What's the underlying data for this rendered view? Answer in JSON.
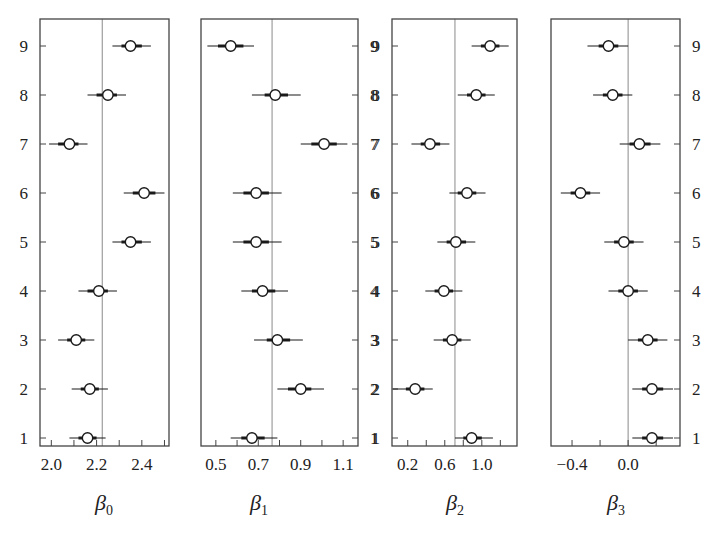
{
  "chart_data": {
    "type": "forest",
    "categories": [
      "1",
      "2",
      "3",
      "4",
      "5",
      "6",
      "7",
      "8",
      "9"
    ],
    "panels": [
      {
        "id": "beta0",
        "xlabel": "β",
        "xlabel_sub": "0",
        "xlim": [
          1.95,
          2.52
        ],
        "xticks_major": [
          2.0,
          2.2,
          2.4
        ],
        "xticks_minor": [
          2.0,
          2.1,
          2.2,
          2.3,
          2.4,
          2.5
        ],
        "tick_labels": [
          "2.0",
          "2.2",
          "2.4"
        ],
        "ref_line": 2.225,
        "ylabels_side": "left",
        "points": [
          {
            "group": 1,
            "est": 2.16,
            "lo": 2.08,
            "hi": 2.24,
            "inner_lo": 2.12,
            "inner_hi": 2.2
          },
          {
            "group": 2,
            "est": 2.17,
            "lo": 2.09,
            "hi": 2.25,
            "inner_lo": 2.13,
            "inner_hi": 2.21
          },
          {
            "group": 3,
            "est": 2.11,
            "lo": 2.03,
            "hi": 2.19,
            "inner_lo": 2.07,
            "inner_hi": 2.15
          },
          {
            "group": 4,
            "est": 2.21,
            "lo": 2.12,
            "hi": 2.29,
            "inner_lo": 2.16,
            "inner_hi": 2.25
          },
          {
            "group": 5,
            "est": 2.35,
            "lo": 2.27,
            "hi": 2.44,
            "inner_lo": 2.31,
            "inner_hi": 2.4
          },
          {
            "group": 6,
            "est": 2.41,
            "lo": 2.32,
            "hi": 2.5,
            "inner_lo": 2.36,
            "inner_hi": 2.46
          },
          {
            "group": 7,
            "est": 2.08,
            "lo": 1.99,
            "hi": 2.16,
            "inner_lo": 2.03,
            "inner_hi": 2.12
          },
          {
            "group": 8,
            "est": 2.25,
            "lo": 2.16,
            "hi": 2.33,
            "inner_lo": 2.2,
            "inner_hi": 2.29
          },
          {
            "group": 9,
            "est": 2.35,
            "lo": 2.27,
            "hi": 2.44,
            "inner_lo": 2.31,
            "inner_hi": 2.4
          }
        ]
      },
      {
        "id": "beta1",
        "xlabel": "β",
        "xlabel_sub": "1",
        "xlim": [
          0.43,
          1.17
        ],
        "xticks_major": [
          0.5,
          0.7,
          0.9,
          1.1
        ],
        "xticks_minor": [
          0.5,
          0.6,
          0.7,
          0.8,
          0.9,
          1.0,
          1.1
        ],
        "tick_labels": [
          "0.5",
          "0.7",
          "0.9",
          "1.1"
        ],
        "ref_line": 0.765,
        "ylabels_side": "right",
        "points": [
          {
            "group": 1,
            "est": 0.67,
            "lo": 0.57,
            "hi": 0.79,
            "inner_lo": 0.62,
            "inner_hi": 0.73
          },
          {
            "group": 2,
            "est": 0.9,
            "lo": 0.79,
            "hi": 1.01,
            "inner_lo": 0.84,
            "inner_hi": 0.95
          },
          {
            "group": 3,
            "est": 0.79,
            "lo": 0.68,
            "hi": 0.91,
            "inner_lo": 0.74,
            "inner_hi": 0.85
          },
          {
            "group": 4,
            "est": 0.72,
            "lo": 0.62,
            "hi": 0.84,
            "inner_lo": 0.67,
            "inner_hi": 0.78
          },
          {
            "group": 5,
            "est": 0.69,
            "lo": 0.58,
            "hi": 0.81,
            "inner_lo": 0.63,
            "inner_hi": 0.75
          },
          {
            "group": 6,
            "est": 0.69,
            "lo": 0.58,
            "hi": 0.81,
            "inner_lo": 0.63,
            "inner_hi": 0.75
          },
          {
            "group": 7,
            "est": 1.01,
            "lo": 0.9,
            "hi": 1.12,
            "inner_lo": 0.95,
            "inner_hi": 1.07
          },
          {
            "group": 8,
            "est": 0.78,
            "lo": 0.67,
            "hi": 0.9,
            "inner_lo": 0.73,
            "inner_hi": 0.84
          },
          {
            "group": 9,
            "est": 0.57,
            "lo": 0.46,
            "hi": 0.68,
            "inner_lo": 0.51,
            "inner_hi": 0.63
          }
        ]
      },
      {
        "id": "beta2",
        "xlabel": "β",
        "xlabel_sub": "2",
        "xlim": [
          0.03,
          1.38
        ],
        "xticks_major": [
          0.2,
          0.6,
          1.0
        ],
        "xticks_minor": [
          0.2,
          0.4,
          0.6,
          0.8,
          1.0,
          1.2
        ],
        "tick_labels": [
          "0.2",
          "0.6",
          "1.0"
        ],
        "ref_line": 0.71,
        "ylabels_side": "left",
        "points": [
          {
            "group": 1,
            "est": 0.89,
            "lo": 0.71,
            "hi": 1.12,
            "inner_lo": 0.8,
            "inner_hi": 1.0
          },
          {
            "group": 2,
            "est": 0.28,
            "lo": 0.04,
            "hi": 0.47,
            "inner_lo": 0.18,
            "inner_hi": 0.38
          },
          {
            "group": 3,
            "est": 0.68,
            "lo": 0.48,
            "hi": 0.88,
            "inner_lo": 0.58,
            "inner_hi": 0.78
          },
          {
            "group": 4,
            "est": 0.59,
            "lo": 0.39,
            "hi": 0.79,
            "inner_lo": 0.49,
            "inner_hi": 0.69
          },
          {
            "group": 5,
            "est": 0.72,
            "lo": 0.52,
            "hi": 0.93,
            "inner_lo": 0.62,
            "inner_hi": 0.83
          },
          {
            "group": 6,
            "est": 0.84,
            "lo": 0.65,
            "hi": 1.04,
            "inner_lo": 0.74,
            "inner_hi": 0.94
          },
          {
            "group": 7,
            "est": 0.44,
            "lo": 0.24,
            "hi": 0.65,
            "inner_lo": 0.34,
            "inner_hi": 0.55
          },
          {
            "group": 8,
            "est": 0.94,
            "lo": 0.74,
            "hi": 1.14,
            "inner_lo": 0.84,
            "inner_hi": 1.04
          },
          {
            "group": 9,
            "est": 1.09,
            "lo": 0.89,
            "hi": 1.29,
            "inner_lo": 0.99,
            "inner_hi": 1.19
          }
        ]
      },
      {
        "id": "beta3",
        "xlabel": "β",
        "xlabel_sub": "3",
        "xlim": [
          -0.55,
          0.37
        ],
        "xticks_major": [
          -0.4,
          0.0
        ],
        "xticks_minor": [
          -0.4,
          -0.2,
          0.0,
          0.2
        ],
        "tick_labels": [
          "−0.4",
          "0.0"
        ],
        "ref_line": 0.0,
        "ylabels_side": "right",
        "points": [
          {
            "group": 1,
            "est": 0.17,
            "lo": 0.03,
            "hi": 0.32,
            "inner_lo": 0.1,
            "inner_hi": 0.25
          },
          {
            "group": 2,
            "est": 0.17,
            "lo": 0.03,
            "hi": 0.32,
            "inner_lo": 0.1,
            "inner_hi": 0.25
          },
          {
            "group": 3,
            "est": 0.14,
            "lo": 0.0,
            "hi": 0.28,
            "inner_lo": 0.07,
            "inner_hi": 0.21
          },
          {
            "group": 4,
            "est": 0.0,
            "lo": -0.14,
            "hi": 0.14,
            "inner_lo": -0.07,
            "inner_hi": 0.07
          },
          {
            "group": 5,
            "est": -0.03,
            "lo": -0.17,
            "hi": 0.11,
            "inner_lo": -0.1,
            "inner_hi": 0.04
          },
          {
            "group": 6,
            "est": -0.34,
            "lo": -0.48,
            "hi": -0.2,
            "inner_lo": -0.41,
            "inner_hi": -0.27
          },
          {
            "group": 7,
            "est": 0.08,
            "lo": -0.06,
            "hi": 0.23,
            "inner_lo": 0.01,
            "inner_hi": 0.16
          },
          {
            "group": 8,
            "est": -0.11,
            "lo": -0.25,
            "hi": 0.03,
            "inner_lo": -0.18,
            "inner_hi": -0.04
          },
          {
            "group": 9,
            "est": -0.14,
            "lo": -0.29,
            "hi": 0.0,
            "inner_lo": -0.21,
            "inner_hi": -0.07
          }
        ]
      }
    ],
    "grid": false,
    "legend": null
  },
  "layout": {
    "panels": [
      {
        "left": 40,
        "right": 169,
        "label_x": 104
      },
      {
        "left": 201,
        "right": 358,
        "label_x": 259
      },
      {
        "left": 392,
        "right": 517,
        "label_x": 455
      },
      {
        "left": 551,
        "right": 680,
        "label_x": 616
      }
    ],
    "top": 19,
    "bottom": 446,
    "row9_y": 46,
    "row1_y": 438,
    "colors": {
      "frame": "#444444",
      "ref_line": "#8a8a8a",
      "marker": "#1a1a1a",
      "text": "#222222"
    }
  }
}
